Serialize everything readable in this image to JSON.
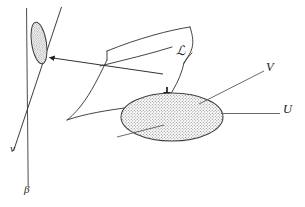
{
  "figure": {
    "kind": "mathematical-diagram",
    "background_color": "#ffffff",
    "ink_color": "#1b1b1b",
    "stipple_color": "#8a8a8a",
    "labels": {
      "surface": "ℒ",
      "vector_V": "V",
      "set_U": "U",
      "line_nu": "ν",
      "line_beta": "β"
    },
    "caption": "",
    "elements": {
      "small_ellipse": {
        "name": "small-stippled-ellipse",
        "cx": 39,
        "cy": 43,
        "rx": 7.5,
        "ry": 21,
        "rotation_deg": -9,
        "fill": "stipple"
      },
      "large_ellipse": {
        "name": "large-stippled-ellipse",
        "cx": 172,
        "cy": 117,
        "rx": 51,
        "ry": 24,
        "rotation_deg": 0,
        "fill": "stipple"
      },
      "vertical_line_beta": {
        "name": "beta-line",
        "x1": 26,
        "y1": 8,
        "x2": 28,
        "y2": 185
      },
      "slanted_line_nu": {
        "name": "nu-line",
        "x1": 61,
        "y1": 8,
        "x2": 14,
        "y2": 150
      },
      "pointer_arrow_to_small_ellipse": {
        "name": "arrow-to-small-ellipse",
        "from_x": 163,
        "from_y": 74,
        "to_x": 47,
        "to_y": 57
      },
      "pointer_arrow_into_large_ellipse": {
        "name": "arrow-into-large-ellipse",
        "from_x": 167,
        "from_y": 88,
        "to_x": 167,
        "to_y": 99
      },
      "leader_line_V": {
        "name": "leader-line-v",
        "from_x": 200,
        "from_y": 103,
        "to_x": 265,
        "to_y": 72
      },
      "leader_line_U": {
        "name": "leader-line-u",
        "from_x": 222,
        "from_y": 113,
        "to_x": 279,
        "to_y": 113
      },
      "leader_line_lower_left": {
        "name": "leader-line-lower-left",
        "from_x": 118,
        "from_y": 136,
        "to_x": 163,
        "to_y": 125
      }
    },
    "label_positions": {
      "surface": {
        "x": 176,
        "y": 46
      },
      "vector_V": {
        "x": 266,
        "y": 62
      },
      "set_U": {
        "x": 283,
        "y": 104
      },
      "line_nu": {
        "x": 10,
        "y": 145
      },
      "line_beta": {
        "x": 24,
        "y": 184
      }
    }
  }
}
